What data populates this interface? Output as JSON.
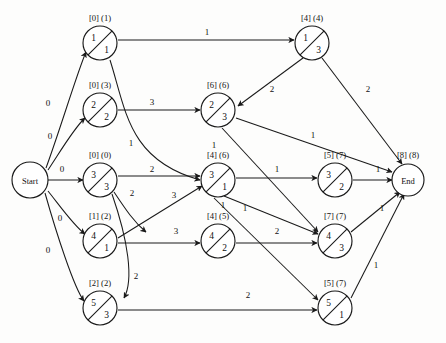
{
  "diagram": {
    "start_label": "Start",
    "end_label": "End",
    "end_bracket": "[8] (8)",
    "nodes": [
      {
        "id": "n1",
        "top": "1",
        "bottom": "1",
        "bracket": "[0] (1)",
        "cx": 100,
        "cy": 43
      },
      {
        "id": "n2",
        "top": "2",
        "bottom": "2",
        "bracket": "[0] (3)",
        "cx": 100,
        "cy": 110
      },
      {
        "id": "n3",
        "top": "3",
        "bottom": "3",
        "bracket": "[0] (0)",
        "cx": 100,
        "cy": 180
      },
      {
        "id": "n4",
        "top": "4",
        "bottom": "1",
        "bracket": "[1] (2)",
        "cx": 100,
        "cy": 241
      },
      {
        "id": "n5",
        "top": "5",
        "bottom": "3",
        "bracket": "[2] (2)",
        "cx": 100,
        "cy": 308
      },
      {
        "id": "m2",
        "top": "2",
        "bottom": "3",
        "bracket": "[6] (6)",
        "cx": 218,
        "cy": 110
      },
      {
        "id": "m3",
        "top": "3",
        "bottom": "1",
        "bracket": "[4] (6)",
        "cx": 218,
        "cy": 180
      },
      {
        "id": "m4",
        "top": "4",
        "bottom": "2",
        "bracket": "[4] (5)",
        "cx": 218,
        "cy": 241
      },
      {
        "id": "r1",
        "top": "1",
        "bottom": "3",
        "bracket": "[4] (4)",
        "cx": 312,
        "cy": 43
      },
      {
        "id": "r3",
        "top": "3",
        "bottom": "2",
        "bracket": "[5] (7)",
        "cx": 335,
        "cy": 180
      },
      {
        "id": "r4",
        "top": "4",
        "bottom": "3",
        "bracket": "[7] (7)",
        "cx": 335,
        "cy": 241
      },
      {
        "id": "r5",
        "top": "5",
        "bottom": "1",
        "bracket": "[5] (7)",
        "cx": 335,
        "cy": 308
      }
    ],
    "start_node": {
      "cx": 30,
      "cy": 180
    },
    "end_node": {
      "cx": 408,
      "cy": 180
    },
    "edge_weights": [
      {
        "id": "w-start-n1",
        "text": "0",
        "x": 48,
        "y": 106
      },
      {
        "id": "w-start-n2",
        "text": "0",
        "x": 50,
        "y": 139
      },
      {
        "id": "w-start-n3",
        "text": "0",
        "x": 62,
        "y": 172
      },
      {
        "id": "w-start-n4",
        "text": "0",
        "x": 60,
        "y": 221
      },
      {
        "id": "w-start-n5",
        "text": "0",
        "x": 48,
        "y": 253
      },
      {
        "id": "w-n1-r1",
        "text": "1",
        "x": 207,
        "y": 35
      },
      {
        "id": "w-n2-m2",
        "text": "3",
        "x": 152,
        "y": 105
      },
      {
        "id": "w-n1-m3",
        "text": "1",
        "x": 131,
        "y": 146
      },
      {
        "id": "w-n3-r3a",
        "text": "2",
        "x": 152,
        "y": 172
      },
      {
        "id": "w-n3-n4",
        "text": "2",
        "x": 132,
        "y": 196
      },
      {
        "id": "w-n4-m3",
        "text": "3",
        "x": 174,
        "y": 198
      },
      {
        "id": "w-n4-m4",
        "text": "3",
        "x": 176,
        "y": 234
      },
      {
        "id": "w-n5-r5",
        "text": "2",
        "x": 248,
        "y": 298
      },
      {
        "id": "w-n3-n5",
        "text": "2",
        "x": 136,
        "y": 279
      },
      {
        "id": "w-r1-m2",
        "text": "2",
        "x": 272,
        "y": 92
      },
      {
        "id": "w-r1-end",
        "text": "2",
        "x": 368,
        "y": 92
      },
      {
        "id": "w-m2-end",
        "text": "1",
        "x": 313,
        "y": 138
      },
      {
        "id": "w-m3-r3",
        "text": "1",
        "x": 277,
        "y": 172
      },
      {
        "id": "w-m2-r4",
        "text": "1",
        "x": 214,
        "y": 148
      },
      {
        "id": "w-m3-r4",
        "text": "1",
        "x": 245,
        "y": 211
      },
      {
        "id": "w-m3-r5",
        "text": "1",
        "x": 223,
        "y": 208
      },
      {
        "id": "w-m4-r4",
        "text": "2",
        "x": 277,
        "y": 234
      },
      {
        "id": "w-r3-end",
        "text": "1",
        "x": 378,
        "y": 172
      },
      {
        "id": "w-r4-end",
        "text": "1",
        "x": 382,
        "y": 211
      },
      {
        "id": "w-r5-end",
        "text": "1",
        "x": 376,
        "y": 268
      }
    ],
    "edges": [
      {
        "id": "e-start-n1",
        "from": "Start",
        "to": "1/1",
        "weight": "0",
        "d": "M 46 168 C 60 130 78 70 86 52"
      },
      {
        "id": "e-start-n2",
        "from": "Start",
        "to": "2/2",
        "weight": "0",
        "d": "M 48 170 C 60 152 74 128 85 118"
      },
      {
        "id": "e-start-n3",
        "from": "Start",
        "to": "3/3",
        "weight": "0",
        "d": "M 48 180 L 83 180"
      },
      {
        "id": "e-start-n4",
        "from": "Start",
        "to": "4/1",
        "weight": "0",
        "d": "M 48 191 C 60 206 74 226 85 234"
      },
      {
        "id": "e-start-n5",
        "from": "Start",
        "to": "5/3",
        "weight": "0",
        "d": "M 45 193 C 56 232 74 288 84 301"
      },
      {
        "id": "e-n1-r1",
        "from": "1/1",
        "to": "1/3",
        "weight": "1",
        "d": "M 118 40 L 294 40"
      },
      {
        "id": "e-n2-m2",
        "from": "2/2",
        "to": "2/3",
        "weight": "3",
        "d": "M 118 110 L 200 110"
      },
      {
        "id": "e-n1-m3",
        "from": "1/1",
        "to": "3/1",
        "weight": "1",
        "d": "M 110 60 C 126 110 128 160 200 180"
      },
      {
        "id": "e-n3-r3a",
        "from": "3/3",
        "to": "3/1",
        "weight": "2",
        "d": "M 118 176 L 200 176"
      },
      {
        "id": "e-n3-n4",
        "from": "3/3",
        "to": "4/1",
        "weight": "2",
        "d": "M 114 192 C 126 210 134 222 146 232"
      },
      {
        "id": "e-n4-m3",
        "from": "4/1",
        "to": "3/1",
        "weight": "3",
        "d": "M 118 238 L 202 186"
      },
      {
        "id": "e-n4-m4",
        "from": "4/1",
        "to": "4/2",
        "weight": "3",
        "d": "M 118 243 L 200 243"
      },
      {
        "id": "e-n3-n5",
        "from": "3/3",
        "to": "5/3",
        "weight": "2",
        "d": "M 112 194 C 128 240 134 280 124 298"
      },
      {
        "id": "e-n5-r5",
        "from": "5/3",
        "to": "5/1",
        "weight": "2",
        "d": "M 118 310 L 317 310"
      },
      {
        "id": "e-r1-m2",
        "from": "1/3",
        "to": "2/3",
        "weight": "2",
        "d": "M 303 58 L 238 106"
      },
      {
        "id": "e-r1-end",
        "from": "1/3",
        "to": "End",
        "weight": "2",
        "d": "M 322 58 L 402 164"
      },
      {
        "id": "e-m2-end",
        "from": "2/3",
        "to": "End",
        "weight": "1",
        "d": "M 236 118 L 392 172"
      },
      {
        "id": "e-m3-r3",
        "from": "3/1",
        "to": "3/2",
        "weight": "1",
        "d": "M 236 178 L 317 178"
      },
      {
        "id": "e-m2-r4",
        "from": "2/3",
        "to": "4/3",
        "weight": "1",
        "d": "M 222 128 L 318 232"
      },
      {
        "id": "e-m3-r4",
        "from": "3/1",
        "to": "4/3",
        "weight": "1",
        "d": "M 224 196 L 318 234"
      },
      {
        "id": "e-m3-r5",
        "from": "3/1",
        "to": "5/1",
        "weight": "1",
        "d": "M 214 198 L 318 300"
      },
      {
        "id": "e-m4-r4",
        "from": "4/2",
        "to": "4/3",
        "weight": "2",
        "d": "M 236 243 L 317 243"
      },
      {
        "id": "e-r3-end",
        "from": "3/2",
        "to": "End",
        "weight": "1",
        "d": "M 353 180 L 392 180"
      },
      {
        "id": "e-r4-end",
        "from": "4/3",
        "to": "End",
        "weight": "1",
        "d": "M 351 232 L 400 192"
      },
      {
        "id": "e-r5-end",
        "from": "5/1",
        "to": "End",
        "weight": "1",
        "d": "M 351 298 L 404 194"
      }
    ]
  }
}
